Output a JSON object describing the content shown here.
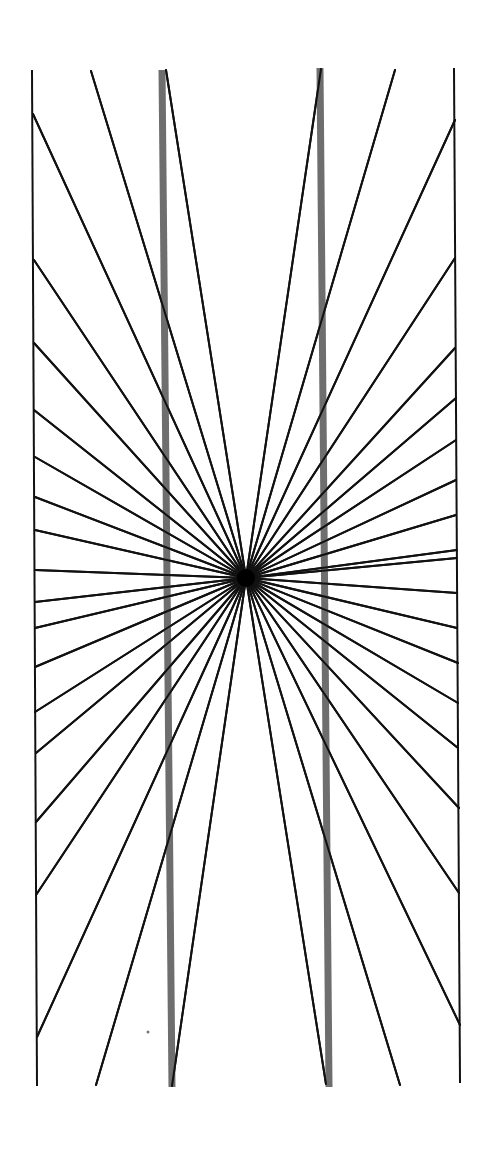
{
  "figure": {
    "width": 492,
    "height": 1161,
    "background": "#ffffff",
    "center": {
      "x": 246,
      "y": 578
    },
    "ray_color": "#111111",
    "ray_width": 2,
    "frame_color": "#111111",
    "frame_width": 2,
    "bar_color": "#6e6e6e",
    "bar_width": 7,
    "frame_lines": [
      {
        "name": "left-border-line",
        "x1": 32,
        "y1": 70,
        "x2": 37,
        "y2": 1086
      },
      {
        "name": "right-border-line",
        "x1": 454,
        "y1": 68,
        "x2": 460,
        "y2": 1083
      }
    ],
    "bars": [
      {
        "name": "left-gray-bar",
        "x1": 162,
        "y1": 70,
        "x2": 172,
        "y2": 1087
      },
      {
        "name": "right-gray-bar",
        "x1": 320,
        "y1": 68,
        "x2": 329,
        "y2": 1087
      }
    ],
    "ray_endpoints": [
      {
        "x": 91,
        "y": 71
      },
      {
        "x": 166,
        "y": 70
      },
      {
        "x": 321,
        "y": 69
      },
      {
        "x": 395,
        "y": 70
      },
      {
        "x": 33,
        "y": 114
      },
      {
        "x": 34,
        "y": 260
      },
      {
        "x": 34,
        "y": 343
      },
      {
        "x": 34,
        "y": 410
      },
      {
        "x": 35,
        "y": 457
      },
      {
        "x": 35,
        "y": 497
      },
      {
        "x": 35,
        "y": 530
      },
      {
        "x": 35,
        "y": 570
      },
      {
        "x": 35,
        "y": 602
      },
      {
        "x": 35,
        "y": 628
      },
      {
        "x": 35,
        "y": 667
      },
      {
        "x": 35,
        "y": 712
      },
      {
        "x": 36,
        "y": 753
      },
      {
        "x": 36,
        "y": 822
      },
      {
        "x": 36,
        "y": 895
      },
      {
        "x": 37,
        "y": 1037
      },
      {
        "x": 96,
        "y": 1085
      },
      {
        "x": 172,
        "y": 1086
      },
      {
        "x": 326,
        "y": 1084
      },
      {
        "x": 400,
        "y": 1085
      },
      {
        "x": 455,
        "y": 120
      },
      {
        "x": 455,
        "y": 258
      },
      {
        "x": 455,
        "y": 348
      },
      {
        "x": 456,
        "y": 398
      },
      {
        "x": 456,
        "y": 440
      },
      {
        "x": 456,
        "y": 480
      },
      {
        "x": 456,
        "y": 515
      },
      {
        "x": 457,
        "y": 550
      },
      {
        "x": 457,
        "y": 558
      },
      {
        "x": 457,
        "y": 593
      },
      {
        "x": 457,
        "y": 628
      },
      {
        "x": 458,
        "y": 663
      },
      {
        "x": 458,
        "y": 703
      },
      {
        "x": 458,
        "y": 748
      },
      {
        "x": 459,
        "y": 808
      },
      {
        "x": 459,
        "y": 893
      },
      {
        "x": 460,
        "y": 1025
      }
    ],
    "speck": {
      "x": 148,
      "y": 1032,
      "r": 1.5,
      "color": "#777777"
    }
  }
}
